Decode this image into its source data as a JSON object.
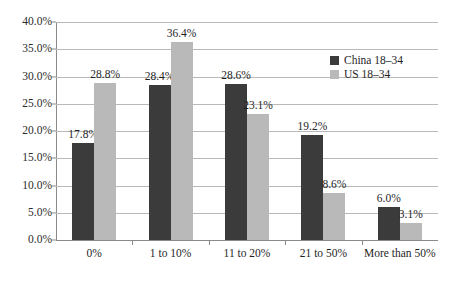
{
  "chart_data": {
    "type": "bar",
    "title": "",
    "subtitle": "",
    "xlabel": "",
    "ylabel": "",
    "categories": [
      "0%",
      "1 to 10%",
      "11 to 20%",
      "21 to 50%",
      "More than 50%"
    ],
    "series": [
      {
        "name": "China 18–34",
        "color": "#3b3b3b",
        "values": [
          17.8,
          28.4,
          28.6,
          19.2,
          6.0
        ],
        "labels": [
          "17.8%",
          "28.4%",
          "28.6%",
          "19.2%",
          "6.0%"
        ]
      },
      {
        "name": "US 18–34",
        "color": "#b9b9b9",
        "values": [
          28.8,
          36.4,
          23.1,
          8.6,
          3.1
        ],
        "labels": [
          "28.8%",
          "36.4%",
          "23.1%",
          "8.6%",
          "3.1%"
        ]
      }
    ],
    "ylim": [
      0,
      40
    ],
    "ytick_values": [
      0,
      5,
      10,
      15,
      20,
      25,
      30,
      35,
      40
    ],
    "ytick_labels": [
      "0.0%",
      "5.0%",
      "10.0%",
      "15.0%",
      "20.0%",
      "25.0%",
      "30.0%",
      "35.0%",
      "40.0%"
    ],
    "grid": true,
    "legend_position": "upper right",
    "axis_color": "#8a8a8a",
    "grid_color": "#b9b9b9",
    "text_color": "#1f1f1f",
    "background": "#ffffff"
  },
  "legend": {
    "entries": [
      {
        "label": "China 18–34"
      },
      {
        "label": "US 18–34"
      }
    ]
  }
}
